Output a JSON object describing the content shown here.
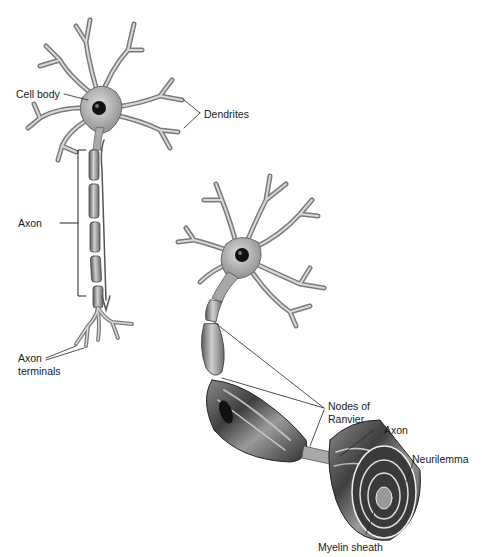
{
  "diagram": {
    "neuron_left": {
      "labels": {
        "cell_body": "Cell body",
        "dendrites": "Dendrites",
        "axon": "Axon",
        "axon_terminals_line1": "Axon",
        "axon_terminals_line2": "terminals"
      }
    },
    "neuron_right": {
      "labels": {
        "nodes_line1": "Nodes of",
        "nodes_line2": "Ranvier",
        "axon": "Axon",
        "neurilemma": "Neurilemma",
        "myelin_sheath": "Myelin sheath"
      }
    },
    "colors": {
      "cell_fill": "#b8b8b8",
      "cell_dark": "#555555",
      "nucleus": "#111111",
      "line": "#222222",
      "sheath_dark": "#4a4a4a",
      "sheath_light": "#c9c9c9"
    }
  }
}
